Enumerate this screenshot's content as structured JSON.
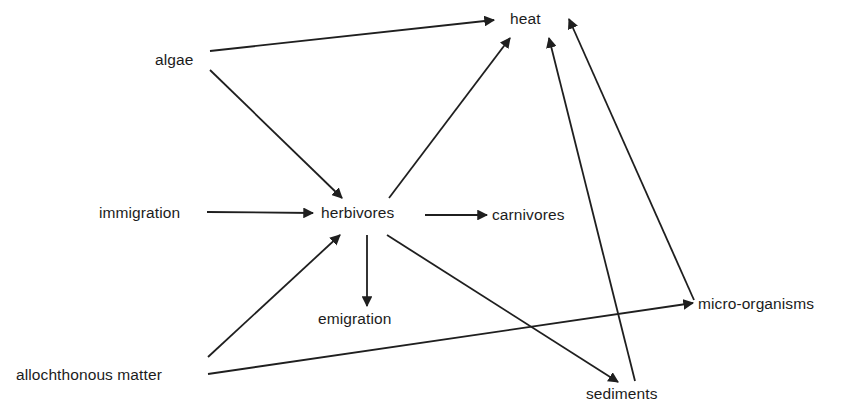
{
  "diagram": {
    "type": "energy-flow",
    "nodes": [
      {
        "id": "heat",
        "label": "heat",
        "x": 510,
        "y": 11
      },
      {
        "id": "algae",
        "label": "algae",
        "x": 155,
        "y": 52
      },
      {
        "id": "immigration",
        "label": "immigration",
        "x": 99,
        "y": 205
      },
      {
        "id": "herbivores",
        "label": "herbivores",
        "x": 321,
        "y": 205
      },
      {
        "id": "carnivores",
        "label": "carnivores",
        "x": 492,
        "y": 207
      },
      {
        "id": "emigration",
        "label": "emigration",
        "x": 318,
        "y": 311
      },
      {
        "id": "micro-organisms",
        "label": "micro-organisms",
        "x": 698,
        "y": 296
      },
      {
        "id": "allochthonous-matter",
        "label": "allochthonous matter",
        "x": 16,
        "y": 367
      },
      {
        "id": "sediments",
        "label": "sediments",
        "x": 586,
        "y": 386
      }
    ],
    "edges": [
      {
        "from": "algae",
        "to": "heat",
        "x1": 210,
        "y1": 51,
        "x2": 494,
        "y2": 20
      },
      {
        "from": "algae",
        "to": "herbivores",
        "x1": 210,
        "y1": 70,
        "x2": 342,
        "y2": 198
      },
      {
        "from": "immigration",
        "to": "herbivores",
        "x1": 207,
        "y1": 212,
        "x2": 313,
        "y2": 213
      },
      {
        "from": "herbivores",
        "to": "heat",
        "x1": 389,
        "y1": 198,
        "x2": 510,
        "y2": 38
      },
      {
        "from": "herbivores",
        "to": "carnivores",
        "x1": 425,
        "y1": 215,
        "x2": 487,
        "y2": 215
      },
      {
        "from": "herbivores",
        "to": "emigration",
        "x1": 367,
        "y1": 235,
        "x2": 367,
        "y2": 306
      },
      {
        "from": "herbivores",
        "to": "sediments",
        "x1": 387,
        "y1": 235,
        "x2": 618,
        "y2": 382
      },
      {
        "from": "allochthonous-matter",
        "to": "herbivores",
        "x1": 208,
        "y1": 357,
        "x2": 340,
        "y2": 235
      },
      {
        "from": "allochthonous-matter",
        "to": "micro-organisms",
        "x1": 208,
        "y1": 374,
        "x2": 693,
        "y2": 303
      },
      {
        "from": "sediments",
        "to": "heat",
        "x1": 635,
        "y1": 381,
        "x2": 549,
        "y2": 38
      },
      {
        "from": "micro-organisms",
        "to": "heat",
        "x1": 694,
        "y1": 300,
        "x2": 569,
        "y2": 19
      }
    ]
  }
}
